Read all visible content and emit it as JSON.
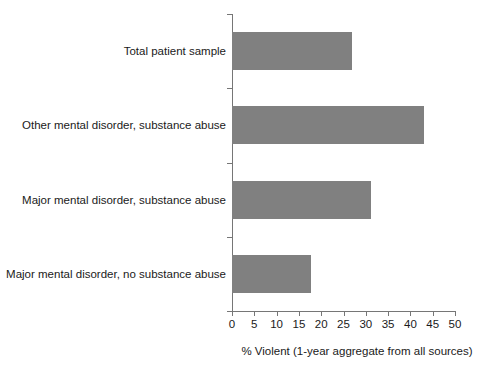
{
  "chart_data": {
    "type": "bar",
    "orientation": "horizontal",
    "title": "",
    "subtitle": "",
    "xlabel": "% Violent (1-year aggregate from all sources)",
    "ylabel": "",
    "categories": [
      "Major mental disorder, no substance abuse",
      "Major mental disorder, substance abuse",
      "Other mental disorder, substance abuse",
      "Total patient sample"
    ],
    "values": [
      17.7,
      31.1,
      43.0,
      27.0
    ],
    "xlim": [
      0,
      50
    ],
    "xticks": [
      0,
      5,
      10,
      15,
      20,
      25,
      30,
      35,
      40,
      45,
      50
    ],
    "xtick_labels": [
      "0",
      "5",
      "10",
      "15",
      "20",
      "25",
      "30",
      "35",
      "40",
      "45",
      "50"
    ],
    "grid": false,
    "legend": null,
    "bar_color": "#808080",
    "axis_color": "#767676",
    "text_color": "#1a1a1a",
    "background": "#ffffff"
  },
  "bars": [
    {
      "label": "Total patient sample",
      "value": 27.0
    },
    {
      "label": "Other mental disorder, substance abuse",
      "value": 43.0
    },
    {
      "label": "Major mental disorder, substance abuse",
      "value": 31.1
    },
    {
      "label": "Major mental disorder, no substance abuse",
      "value": 17.7
    }
  ],
  "axis": {
    "x_title": "% Violent (1-year aggregate from all sources)",
    "ticks": [
      "0",
      "5",
      "10",
      "15",
      "20",
      "25",
      "30",
      "35",
      "40",
      "45",
      "50"
    ]
  }
}
